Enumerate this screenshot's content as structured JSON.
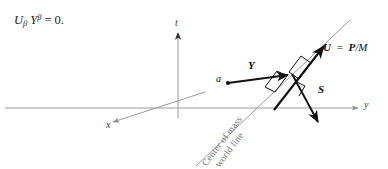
{
  "figure": {
    "kind": "spacetime-diagram",
    "background": "#ffffff",
    "colors": {
      "axis": "#9a9a9a",
      "worldline": "#9a9a9a",
      "vector": "#111111",
      "text": "#1a1a1a",
      "worldline_text": "#6f6f6f"
    }
  },
  "equation": {
    "U": "U",
    "U_sub": "β",
    "Y": "Y",
    "Y_sup": "β",
    "equals": "=",
    "rhs": "0."
  },
  "axes": [
    {
      "name": "t-axis",
      "label": "t",
      "direction": "up"
    },
    {
      "name": "y-axis",
      "label": "y",
      "direction": "right"
    },
    {
      "name": "x-axis",
      "label": "x",
      "direction": "down-left"
    }
  ],
  "vectors": [
    {
      "name": "U",
      "label": "U",
      "equation_label": "U  =  P/M",
      "symbol": "U",
      "rhs_bold": "P",
      "rhs_plain": "/M",
      "direction": "up-right"
    },
    {
      "name": "Y",
      "label": "Y",
      "direction": "right"
    },
    {
      "name": "S",
      "label": "S",
      "direction": "down-right"
    }
  ],
  "points": [
    {
      "name": "a",
      "label": "a"
    }
  ],
  "worldline": {
    "label_line1": "Center of mass",
    "label_line2": "world line"
  }
}
